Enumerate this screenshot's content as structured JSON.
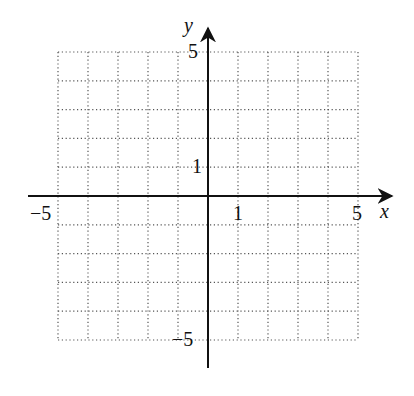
{
  "diagram": {
    "type": "coordinate-grid",
    "x_axis": {
      "label": "x",
      "min": -5,
      "max": 5,
      "tick_labels": [
        "−5",
        "1",
        "5"
      ]
    },
    "y_axis": {
      "label": "y",
      "min": -5,
      "max": 5,
      "tick_labels": [
        "5",
        "1",
        "−5"
      ]
    },
    "grid": {
      "cells_x": 10,
      "cells_y": 10,
      "style": "dotted"
    },
    "colors": {
      "axis": "#111111",
      "grid": "#555555",
      "background": "#ffffff"
    }
  }
}
